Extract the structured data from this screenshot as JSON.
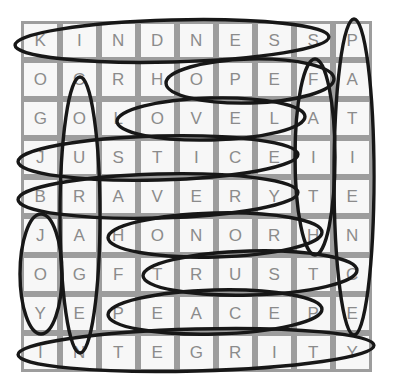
{
  "puzzle": {
    "type": "word-search",
    "rows": 9,
    "cols": 9,
    "grid": [
      [
        "K",
        "I",
        "N",
        "D",
        "N",
        "E",
        "S",
        "S",
        "P"
      ],
      [
        "O",
        "C",
        "R",
        "H",
        "O",
        "P",
        "E",
        "F",
        "A"
      ],
      [
        "G",
        "O",
        "L",
        "O",
        "V",
        "E",
        "L",
        "A",
        "T"
      ],
      [
        "J",
        "U",
        "S",
        "T",
        "I",
        "C",
        "E",
        "I",
        "I"
      ],
      [
        "B",
        "R",
        "A",
        "V",
        "E",
        "R",
        "Y",
        "T",
        "E"
      ],
      [
        "J",
        "A",
        "H",
        "O",
        "N",
        "O",
        "R",
        "H",
        "N"
      ],
      [
        "O",
        "G",
        "F",
        "T",
        "R",
        "U",
        "S",
        "T",
        "C"
      ],
      [
        "Y",
        "E",
        "P",
        "E",
        "A",
        "C",
        "E",
        "P",
        "E"
      ],
      [
        "I",
        "N",
        "T",
        "E",
        "G",
        "R",
        "I",
        "T",
        "Y"
      ]
    ],
    "row_strings": [
      "KINDNESSP",
      "OCRHOPEFA",
      "GOLOVELAT",
      "JUSTICEII",
      "BRAVERYTE",
      "JAHONORHN",
      "OGFTRUSTC",
      "YEPEACEPE",
      "INTEGRITY"
    ],
    "found_words": [
      {
        "word": "KINDNESS",
        "orientation": "horizontal",
        "row": 1,
        "col_start": 1,
        "col_end": 8
      },
      {
        "word": "HOPE",
        "orientation": "horizontal",
        "row": 2,
        "col_start": 4,
        "col_end": 7
      },
      {
        "word": "LOVE",
        "orientation": "horizontal",
        "row": 3,
        "col_start": 3,
        "col_end": 6
      },
      {
        "word": "JUSTICE",
        "orientation": "horizontal",
        "row": 4,
        "col_start": 1,
        "col_end": 7
      },
      {
        "word": "BRAVERY",
        "orientation": "horizontal",
        "row": 5,
        "col_start": 1,
        "col_end": 7
      },
      {
        "word": "HONOR",
        "orientation": "horizontal",
        "row": 6,
        "col_start": 3,
        "col_end": 7
      },
      {
        "word": "TRUST",
        "orientation": "horizontal",
        "row": 7,
        "col_start": 4,
        "col_end": 8
      },
      {
        "word": "PEACE",
        "orientation": "horizontal",
        "row": 8,
        "col_start": 3,
        "col_end": 7
      },
      {
        "word": "INTEGRITY",
        "orientation": "horizontal",
        "row": 9,
        "col_start": 1,
        "col_end": 9
      },
      {
        "word": "JOY",
        "orientation": "vertical",
        "col": 1,
        "row_start": 6,
        "row_end": 8
      },
      {
        "word": "COURAGE",
        "orientation": "vertical",
        "col": 2,
        "row_start": 2,
        "row_end": 8
      },
      {
        "word": "FAITH",
        "orientation": "vertical",
        "col": 8,
        "row_start": 2,
        "row_end": 6
      },
      {
        "word": "PATIENCE",
        "orientation": "vertical",
        "col": 9,
        "row_start": 1,
        "row_end": 8
      }
    ],
    "colors": {
      "page_background": "#ffffff",
      "grid_line": "#9d9d9d",
      "cell_background": "#f7f7f7",
      "letter": "#8b8b8b",
      "circle_stroke": "#171717"
    }
  },
  "chart_data": {
    "type": "table",
    "title": "",
    "categories": [
      "C1",
      "C2",
      "C3",
      "C4",
      "C5",
      "C6",
      "C7",
      "C8",
      "C9"
    ],
    "rows": [
      [
        "K",
        "I",
        "N",
        "D",
        "N",
        "E",
        "S",
        "S",
        "P"
      ],
      [
        "O",
        "C",
        "R",
        "H",
        "O",
        "P",
        "E",
        "F",
        "A"
      ],
      [
        "G",
        "O",
        "L",
        "O",
        "V",
        "E",
        "L",
        "A",
        "T"
      ],
      [
        "J",
        "U",
        "S",
        "T",
        "I",
        "C",
        "E",
        "I",
        "I"
      ],
      [
        "B",
        "R",
        "A",
        "V",
        "E",
        "R",
        "Y",
        "T",
        "E"
      ],
      [
        "J",
        "A",
        "H",
        "O",
        "N",
        "O",
        "R",
        "H",
        "N"
      ],
      [
        "O",
        "G",
        "F",
        "T",
        "R",
        "U",
        "S",
        "T",
        "C"
      ],
      [
        "Y",
        "E",
        "P",
        "E",
        "A",
        "C",
        "E",
        "P",
        "E"
      ],
      [
        "I",
        "N",
        "T",
        "E",
        "G",
        "R",
        "I",
        "T",
        "Y"
      ]
    ]
  },
  "circles": [
    {
      "name": "kindness",
      "cx": 172,
      "cy": 41,
      "rx": 157,
      "ry": 21,
      "rot": -1.5
    },
    {
      "name": "hope",
      "cx": 250,
      "cy": 81,
      "rx": 84,
      "ry": 22,
      "rot": -1.5
    },
    {
      "name": "love",
      "cx": 211,
      "cy": 119,
      "rx": 94,
      "ry": 21,
      "rot": -1.5
    },
    {
      "name": "justice",
      "cx": 158,
      "cy": 158,
      "rx": 140,
      "ry": 22,
      "rot": -1.5
    },
    {
      "name": "bravery",
      "cx": 158,
      "cy": 196,
      "rx": 140,
      "ry": 22,
      "rot": -1.5
    },
    {
      "name": "honor",
      "cx": 215,
      "cy": 235,
      "rx": 107,
      "ry": 22,
      "rot": -1.5
    },
    {
      "name": "trust",
      "cx": 250,
      "cy": 273,
      "rx": 107,
      "ry": 22,
      "rot": -1.5
    },
    {
      "name": "peace",
      "cx": 215,
      "cy": 312,
      "rx": 107,
      "ry": 22,
      "rot": -1.5
    },
    {
      "name": "integrity",
      "cx": 196,
      "cy": 350,
      "rx": 178,
      "ry": 21,
      "rot": -1.5
    },
    {
      "name": "joy",
      "cx": 41,
      "cy": 274,
      "rx": 21,
      "ry": 60,
      "rot": 0
    },
    {
      "name": "courage",
      "cx": 80,
      "cy": 215,
      "rx": 20,
      "ry": 138,
      "rot": 0
    },
    {
      "name": "faith",
      "cx": 315,
      "cy": 157,
      "rx": 20,
      "ry": 98,
      "rot": 0
    },
    {
      "name": "patience",
      "cx": 354,
      "cy": 177,
      "rx": 20,
      "ry": 158,
      "rot": 0
    }
  ]
}
